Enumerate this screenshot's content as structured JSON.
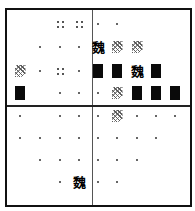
{
  "board": {
    "columns": 9,
    "rows": 8,
    "column_centers_px": [
      20,
      40,
      60,
      79,
      98,
      117,
      137,
      156,
      175
    ],
    "row_centers_px": [
      24,
      47,
      71,
      93,
      116,
      138,
      160,
      182
    ],
    "colors": {
      "border": "#111111",
      "block": "#0a0a0a",
      "dot": "#666666",
      "background": "#ffffff"
    },
    "glyph_char": "魏",
    "legend": {
      "dot": "empty-cell-marker",
      "quad": "four-dot-marker",
      "hatch": "hatched-tile",
      "block": "solid-black-tile",
      "glyph": "bold-character-tile"
    }
  },
  "cells": [
    {
      "row": 1,
      "col": 3,
      "type": "quad"
    },
    {
      "row": 1,
      "col": 4,
      "type": "quad"
    },
    {
      "row": 1,
      "col": 5,
      "type": "dot"
    },
    {
      "row": 1,
      "col": 6,
      "type": "dot"
    },
    {
      "row": 2,
      "col": 2,
      "type": "dot"
    },
    {
      "row": 2,
      "col": 3,
      "type": "dot"
    },
    {
      "row": 2,
      "col": 4,
      "type": "dot"
    },
    {
      "row": 2,
      "col": 5,
      "type": "glyph"
    },
    {
      "row": 2,
      "col": 6,
      "type": "hatch"
    },
    {
      "row": 2,
      "col": 7,
      "type": "hatch"
    },
    {
      "row": 3,
      "col": 1,
      "type": "hatch"
    },
    {
      "row": 3,
      "col": 2,
      "type": "dot"
    },
    {
      "row": 3,
      "col": 3,
      "type": "quad"
    },
    {
      "row": 3,
      "col": 4,
      "type": "dot"
    },
    {
      "row": 3,
      "col": 5,
      "type": "block"
    },
    {
      "row": 3,
      "col": 6,
      "type": "block"
    },
    {
      "row": 3,
      "col": 7,
      "type": "glyph"
    },
    {
      "row": 3,
      "col": 8,
      "type": "block"
    },
    {
      "row": 4,
      "col": 1,
      "type": "block"
    },
    {
      "row": 4,
      "col": 3,
      "type": "dot"
    },
    {
      "row": 4,
      "col": 4,
      "type": "dot"
    },
    {
      "row": 4,
      "col": 5,
      "type": "dot"
    },
    {
      "row": 4,
      "col": 6,
      "type": "hatch"
    },
    {
      "row": 4,
      "col": 7,
      "type": "block"
    },
    {
      "row": 4,
      "col": 8,
      "type": "block"
    },
    {
      "row": 4,
      "col": 9,
      "type": "block"
    },
    {
      "row": 5,
      "col": 1,
      "type": "dot"
    },
    {
      "row": 5,
      "col": 3,
      "type": "dot"
    },
    {
      "row": 5,
      "col": 4,
      "type": "dot"
    },
    {
      "row": 5,
      "col": 5,
      "type": "dot"
    },
    {
      "row": 5,
      "col": 6,
      "type": "hatch"
    },
    {
      "row": 5,
      "col": 7,
      "type": "dot"
    },
    {
      "row": 5,
      "col": 8,
      "type": "dot"
    },
    {
      "row": 5,
      "col": 9,
      "type": "dot"
    },
    {
      "row": 6,
      "col": 1,
      "type": "dot"
    },
    {
      "row": 6,
      "col": 2,
      "type": "dot"
    },
    {
      "row": 6,
      "col": 3,
      "type": "dot"
    },
    {
      "row": 6,
      "col": 4,
      "type": "dot"
    },
    {
      "row": 6,
      "col": 5,
      "type": "dot"
    },
    {
      "row": 6,
      "col": 6,
      "type": "dot"
    },
    {
      "row": 6,
      "col": 7,
      "type": "dot"
    },
    {
      "row": 6,
      "col": 8,
      "type": "dot"
    },
    {
      "row": 7,
      "col": 2,
      "type": "dot"
    },
    {
      "row": 7,
      "col": 3,
      "type": "dot"
    },
    {
      "row": 7,
      "col": 4,
      "type": "dot"
    },
    {
      "row": 7,
      "col": 5,
      "type": "dot"
    },
    {
      "row": 7,
      "col": 6,
      "type": "dot"
    },
    {
      "row": 7,
      "col": 7,
      "type": "dot"
    },
    {
      "row": 8,
      "col": 3,
      "type": "dot"
    },
    {
      "row": 8,
      "col": 4,
      "type": "glyph"
    },
    {
      "row": 8,
      "col": 5,
      "type": "dot"
    },
    {
      "row": 8,
      "col": 6,
      "type": "dot"
    }
  ]
}
